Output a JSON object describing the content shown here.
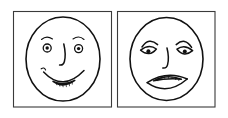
{
  "image": {
    "title": "Two hand-drawn faces",
    "description": "Black ink line drawing of two framed panels side by side: a smiling happy face on the left and a frowning sad face on the right.",
    "background_color": "#ffffff",
    "ink_color": "#111111",
    "frame_color": "#3a3a3a",
    "width": 228,
    "height": 118
  },
  "panels": [
    {
      "id": "happy",
      "label": "Happy face panel",
      "face": {
        "name": "smiling-face",
        "expression": "happy",
        "mouth": "smile-with-teeth",
        "eyes": "round-open-eyes-with-pupils",
        "eyebrows": "raised-arched-eyebrows",
        "nose": "curved-line-nose"
      }
    },
    {
      "id": "sad",
      "label": "Sad face panel",
      "face": {
        "name": "frowning-face",
        "expression": "sad",
        "mouth": "frown-with-teeth",
        "eyes": "drooping-almond-eyes-with-dot-pupils",
        "eyebrows": "downturned-worried-eyebrows",
        "nose": "curved-line-nose"
      }
    }
  ]
}
